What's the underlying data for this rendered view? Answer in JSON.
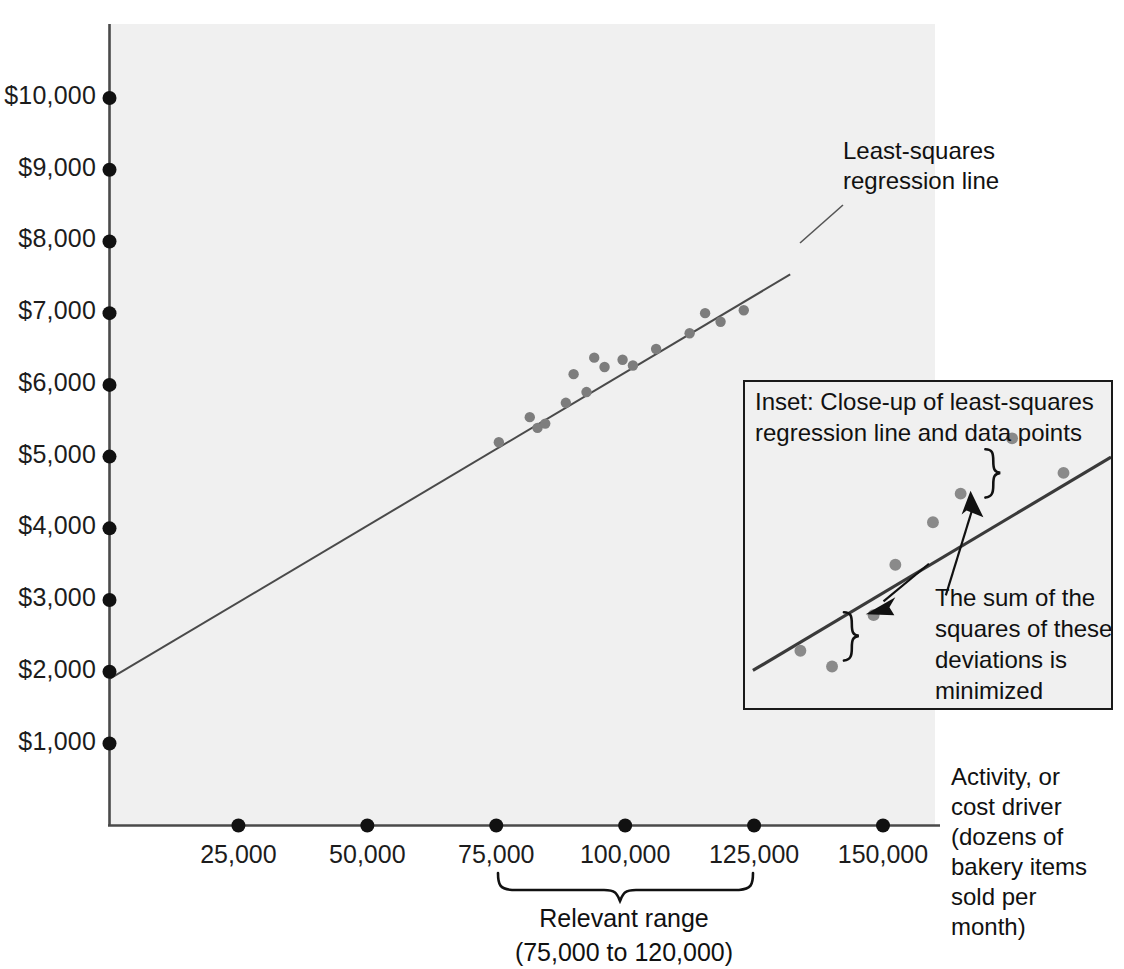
{
  "chart_data": {
    "type": "scatter",
    "title": "",
    "xlabel": "Activity, or cost driver (dozens of bakery items sold per month)",
    "ylabel": "",
    "xlim": [
      0,
      160000
    ],
    "ylim": [
      0,
      10400
    ],
    "grid": false,
    "legend_position": "none",
    "x_tick_labels": [
      "25,000",
      "50,000",
      "75,000",
      "100,000",
      "125,000",
      "150,000"
    ],
    "x_tick_values": [
      25000,
      50000,
      75000,
      100000,
      125000,
      150000
    ],
    "y_tick_labels": [
      "$1,000",
      "$2,000",
      "$3,000",
      "$4,000",
      "$5,000",
      "$6,000",
      "$7,000",
      "$8,000",
      "$9,000",
      "$10,000"
    ],
    "y_tick_values": [
      1000,
      2000,
      3000,
      4000,
      5000,
      6000,
      7000,
      8000,
      9000,
      10000
    ],
    "series": [
      {
        "name": "Monthly cost observations",
        "marker": "circle",
        "color": "#7d7d7d",
        "points": [
          {
            "x": 75500,
            "y": 5200
          },
          {
            "x": 81500,
            "y": 5550
          },
          {
            "x": 83000,
            "y": 5400
          },
          {
            "x": 84500,
            "y": 5460
          },
          {
            "x": 88500,
            "y": 5750
          },
          {
            "x": 90000,
            "y": 6150
          },
          {
            "x": 92500,
            "y": 5900
          },
          {
            "x": 94000,
            "y": 6380
          },
          {
            "x": 96000,
            "y": 6250
          },
          {
            "x": 99500,
            "y": 6350
          },
          {
            "x": 101500,
            "y": 6270
          },
          {
            "x": 106000,
            "y": 6500
          },
          {
            "x": 112500,
            "y": 6720
          },
          {
            "x": 115500,
            "y": 7000
          },
          {
            "x": 118500,
            "y": 6880
          },
          {
            "x": 123000,
            "y": 7040
          }
        ]
      }
    ],
    "fit_line": {
      "name": "Least-squares regression line",
      "color": "#4a4a4a",
      "intercept": 1900,
      "slope_per_unit": 0.0427,
      "x_start": 0,
      "x_end": 132000,
      "y_start": 1900,
      "y_end": 7540
    },
    "annotations": [
      {
        "name": "regression-line-label",
        "text": "Least-squares\nregression line"
      },
      {
        "name": "relevant-range-label",
        "text": "Relevant range\n(75,000 to 120,000)",
        "from": 75000,
        "to": 125000
      }
    ]
  },
  "axes": {
    "y_ticks": [
      {
        "label": "$10,000",
        "value": 10000
      },
      {
        "label": "$9,000",
        "value": 9000
      },
      {
        "label": "$8,000",
        "value": 8000
      },
      {
        "label": "$7,000",
        "value": 7000
      },
      {
        "label": "$6,000",
        "value": 6000
      },
      {
        "label": "$5,000",
        "value": 5000
      },
      {
        "label": "$4,000",
        "value": 4000
      },
      {
        "label": "$3,000",
        "value": 3000
      },
      {
        "label": "$2,000",
        "value": 2000
      },
      {
        "label": "$1,000",
        "value": 1000
      }
    ],
    "x_ticks": [
      {
        "label": "25,000",
        "value": 25000
      },
      {
        "label": "50,000",
        "value": 50000
      },
      {
        "label": "75,000",
        "value": 75000
      },
      {
        "label": "100,000",
        "value": 100000
      },
      {
        "label": "125,000",
        "value": 125000
      },
      {
        "label": "150,000",
        "value": 150000
      }
    ],
    "x_axis_caption": "Activity, or\ncost driver\n(dozens of\nbakery items\nsold per\nmonth)"
  },
  "callouts": {
    "regression_line": "Least-squares\nregression line",
    "relevant_range": "Relevant range\n(75,000 to 120,000)"
  },
  "inset": {
    "title": "Inset: Close-up of least-squares\nregression line and data points",
    "note": "The sum of the\nsquares of these\ndeviations is\nminimized",
    "points": [
      {
        "cx": 56,
        "cy": 272
      },
      {
        "cx": 88,
        "cy": 288
      },
      {
        "cx": 130,
        "cy": 236
      },
      {
        "cx": 152,
        "cy": 185
      },
      {
        "cx": 190,
        "cy": 142
      },
      {
        "cx": 218,
        "cy": 113
      },
      {
        "cx": 270,
        "cy": 57
      },
      {
        "cx": 322,
        "cy": 92
      }
    ],
    "line": {
      "x1": 8,
      "y1": 292,
      "x2": 370,
      "y2": 76
    }
  },
  "colors": {
    "plot_background": "#f0f0f0",
    "axis": "#4a4a4a",
    "tick_dot": "#111111",
    "data_point": "#7d7d7d",
    "regression_line": "#4a4a4a",
    "inset_border": "#1a1a1a",
    "text": "#111111"
  }
}
